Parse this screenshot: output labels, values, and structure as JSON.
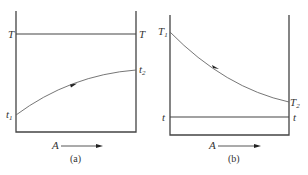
{
  "diagrams": {
    "a": {
      "caption": "(a)",
      "top_line_label_left": "T",
      "top_line_label_right": "T",
      "curve_start_label": "t",
      "curve_start_sub": "1",
      "curve_end_label": "t",
      "curve_end_sub": "2",
      "axis_label": "A"
    },
    "b": {
      "caption": "(b)",
      "curve_start_label": "T",
      "curve_start_sub": "1",
      "curve_end_label": "T",
      "curve_end_sub": "2",
      "bottom_line_label_left": "t",
      "bottom_line_label_right": "t",
      "axis_label": "A"
    }
  },
  "colors": {
    "line": "#444444",
    "curve": "#666666"
  }
}
